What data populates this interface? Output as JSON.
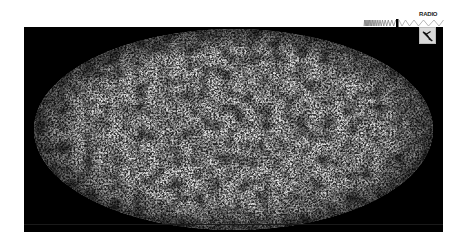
{
  "figure": {
    "projection": "mollweide-all-sky",
    "panel_color": "#000000",
    "background_color": "#ffffff",
    "map_tone": "grayscale-noise"
  },
  "spectrum_indicator": {
    "band_label": "RADIO",
    "band_icon": "satellite-dish-icon",
    "marker_color": "#000000",
    "strip_color": "#ffffff"
  }
}
